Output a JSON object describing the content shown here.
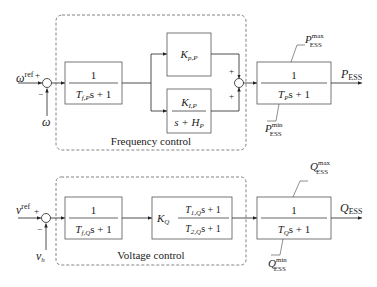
{
  "frequency": {
    "input_ref": "ω",
    "input_ref_sup": "ref",
    "feedback": "ω",
    "plus": "+",
    "minus": "−",
    "filter": {
      "num": "1",
      "den_T": "T",
      "den_sub": "f,P",
      "den_tail": "s + 1"
    },
    "kp": {
      "K": "K",
      "sub": "p,P"
    },
    "ki": {
      "num_K": "K",
      "num_sub": "I,P",
      "den": "s + H",
      "den_sub": "P"
    },
    "sum_plus_top": "+",
    "sum_plus_bottom": "+",
    "label": "Frequency control",
    "ess": {
      "num": "1",
      "den_T": "T",
      "den_sub": "P",
      "den_tail": "s + 1"
    },
    "max": {
      "sym": "P",
      "sup": "max",
      "sub": "ESS"
    },
    "min": {
      "sym": "P",
      "sup": "min",
      "sub": "ESS"
    },
    "output": {
      "sym": "P",
      "sub": "ESS"
    }
  },
  "voltage": {
    "input_ref": "v",
    "input_ref_sup": "ref",
    "feedback": "v",
    "feedback_sub": "h",
    "plus": "+",
    "minus": "−",
    "filter": {
      "num": "1",
      "den_T": "T",
      "den_sub": "f,Q",
      "den_tail": "s + 1"
    },
    "leadlag": {
      "K": "K",
      "K_sub": "Q",
      "num_T": "T",
      "num_sub": "1,Q",
      "num_tail": "s + 1",
      "den_T": "T",
      "den_sub": "2,Q",
      "den_tail": "s + 1"
    },
    "label": "Voltage control",
    "ess": {
      "num": "1",
      "den_T": "T",
      "den_sub": "Q",
      "den_tail": "s + 1"
    },
    "max": {
      "sym": "Q",
      "sup": "max",
      "sub": "ESS"
    },
    "min": {
      "sym": "Q",
      "sup": "min",
      "sub": "ESS"
    },
    "output": {
      "sym": "Q",
      "sub": "ESS"
    }
  }
}
